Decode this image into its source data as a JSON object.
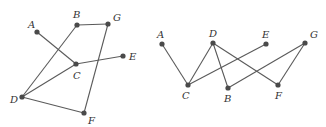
{
  "diagram": {
    "type": "graph-isomorphism-pair",
    "colors": {
      "edge": "#5a5a5a",
      "node": "#4a4a4a",
      "label": "#333333",
      "background": "#ffffff"
    },
    "graphs": [
      {
        "id": "left",
        "nodes": [
          {
            "id": "A",
            "label": "A",
            "x": 37,
            "y": 32,
            "lx": 28,
            "ly": 28
          },
          {
            "id": "B",
            "label": "B",
            "x": 77,
            "y": 25,
            "lx": 73,
            "ly": 18
          },
          {
            "id": "G",
            "label": "G",
            "x": 108,
            "y": 24,
            "lx": 113,
            "ly": 21
          },
          {
            "id": "C",
            "label": "C",
            "x": 76,
            "y": 64,
            "lx": 73,
            "ly": 79
          },
          {
            "id": "E",
            "label": "E",
            "x": 123,
            "y": 56,
            "lx": 129,
            "ly": 60
          },
          {
            "id": "D",
            "label": "D",
            "x": 22,
            "y": 97,
            "lx": 10,
            "ly": 103
          },
          {
            "id": "F",
            "label": "F",
            "x": 84,
            "y": 113,
            "lx": 88,
            "ly": 124
          }
        ],
        "edges": [
          [
            "A",
            "C"
          ],
          [
            "B",
            "G"
          ],
          [
            "B",
            "D"
          ],
          [
            "C",
            "E"
          ],
          [
            "C",
            "D"
          ],
          [
            "G",
            "F"
          ],
          [
            "D",
            "F"
          ]
        ]
      },
      {
        "id": "right",
        "nodes": [
          {
            "id": "A",
            "label": "A",
            "x": 162,
            "y": 44,
            "lx": 157,
            "ly": 38
          },
          {
            "id": "D",
            "label": "D",
            "x": 213,
            "y": 43,
            "lx": 209,
            "ly": 37
          },
          {
            "id": "E",
            "label": "E",
            "x": 266,
            "y": 44,
            "lx": 262,
            "ly": 38
          },
          {
            "id": "G",
            "label": "G",
            "x": 305,
            "y": 43,
            "lx": 310,
            "ly": 38
          },
          {
            "id": "C",
            "label": "C",
            "x": 188,
            "y": 85,
            "lx": 182,
            "ly": 99
          },
          {
            "id": "B",
            "label": "B",
            "x": 228,
            "y": 88,
            "lx": 224,
            "ly": 102
          },
          {
            "id": "F",
            "label": "F",
            "x": 278,
            "y": 85,
            "lx": 275,
            "ly": 99
          }
        ],
        "edges": [
          [
            "A",
            "C"
          ],
          [
            "D",
            "C"
          ],
          [
            "D",
            "B"
          ],
          [
            "D",
            "F"
          ],
          [
            "E",
            "C"
          ],
          [
            "G",
            "B"
          ],
          [
            "G",
            "F"
          ]
        ]
      }
    ]
  }
}
